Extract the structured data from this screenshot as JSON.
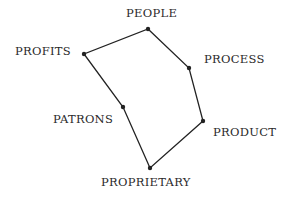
{
  "diagram": {
    "type": "hexagon-loop",
    "line_color": "#222222",
    "nodes": [
      {
        "id": "people",
        "label": "PEOPLE",
        "x": 148,
        "y": 29,
        "label_x": 126,
        "label_y": 8
      },
      {
        "id": "process",
        "label": "PROCESS",
        "x": 189,
        "y": 68,
        "label_x": 204,
        "label_y": 54
      },
      {
        "id": "product",
        "label": "PRODUCT",
        "x": 203,
        "y": 121,
        "label_x": 213,
        "label_y": 127
      },
      {
        "id": "proprietary",
        "label": "PROPRIETARY",
        "x": 150,
        "y": 168,
        "label_x": 101,
        "label_y": 177
      },
      {
        "id": "patrons",
        "label": "PATRONS",
        "x": 123,
        "y": 107,
        "label_x": 53,
        "label_y": 114
      },
      {
        "id": "profits",
        "label": "PROFITS",
        "x": 84,
        "y": 54,
        "label_x": 15,
        "label_y": 46
      }
    ]
  }
}
